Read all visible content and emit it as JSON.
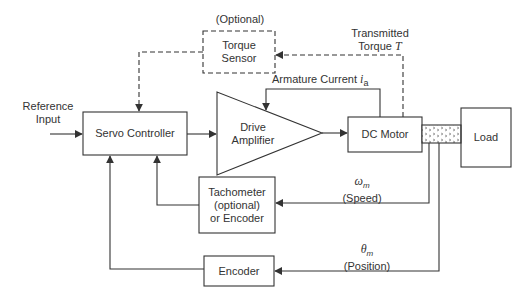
{
  "diagram": {
    "type": "block-diagram",
    "blocks": {
      "torque_sensor": {
        "label_line1": "Torque",
        "label_line2": "Sensor",
        "note": "(Optional)",
        "style": "dashed"
      },
      "servo_controller": {
        "label": "Servo Controller"
      },
      "drive_amplifier": {
        "label_line1": "Drive",
        "label_line2": "Amplifier",
        "shape": "triangle"
      },
      "dc_motor": {
        "label": "DC Motor"
      },
      "load": {
        "label": "Load"
      },
      "tachometer": {
        "label_line1": "Tachometer",
        "label_line2": "(optional)",
        "label_line3": "or Encoder"
      },
      "encoder": {
        "label": "Encoder"
      }
    },
    "signals": {
      "reference_input": {
        "line1": "Reference",
        "line2": "Input"
      },
      "transmitted_torque": {
        "line1": "Transmitted",
        "line2_prefix": "Torque ",
        "symbol": "T"
      },
      "armature_current": {
        "prefix": "Armature Current ",
        "symbol": "i",
        "subscript": "a"
      },
      "speed": {
        "symbol": "ω",
        "subscript": "m",
        "label": "(Speed)"
      },
      "position": {
        "symbol": "θ",
        "subscript": "m",
        "label": "(Position)"
      }
    },
    "colors": {
      "line": "#333333",
      "background": "#ffffff",
      "hatch": "#555555"
    }
  }
}
